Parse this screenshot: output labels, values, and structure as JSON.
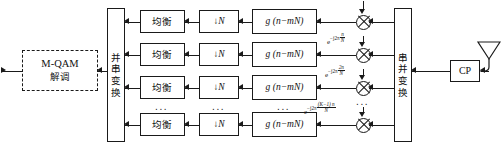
{
  "diagram": {
    "demod": {
      "line1": "M-QAM",
      "line2": "解调"
    },
    "p2s": {
      "chars": [
        "并",
        "串",
        "变",
        "换"
      ]
    },
    "s2p": {
      "chars": [
        "串",
        "并",
        "变",
        "换"
      ]
    },
    "cp": {
      "label": "CP"
    },
    "antenna": {
      "label": "antenna"
    },
    "ellipsis": "...",
    "rows": [
      {
        "equalizer": "均衡",
        "downsample_arrow": "↓",
        "downsample_factor": "N",
        "filter": "g (n−mN)",
        "exponent": ""
      },
      {
        "equalizer": "均衡",
        "downsample_arrow": "↓",
        "downsample_factor": "N",
        "filter": "g (n−mN)",
        "exponent": "e^{-j2π n/N}"
      },
      {
        "equalizer": "均衡",
        "downsample_arrow": "↓",
        "downsample_factor": "N",
        "filter": "g (n−mN)",
        "exponent": "e^{-j2π 2n/N}"
      },
      {
        "equalizer": "均衡",
        "downsample_arrow": "↓",
        "downsample_factor": "N",
        "filter": "g (n−mN)",
        "exponent": "e^{-j2π (K-1)n/N}"
      }
    ],
    "exponent_parts": {
      "base": "e",
      "sup_prefix": "−j2π",
      "row2_num": "n",
      "row2_den": "N",
      "row3_num": "2n",
      "row3_den": "N",
      "row4_num": "(K−1) n",
      "row4_den": "N"
    },
    "colors": {
      "stroke": "#1a1a1a",
      "background": "#ffffff"
    }
  }
}
